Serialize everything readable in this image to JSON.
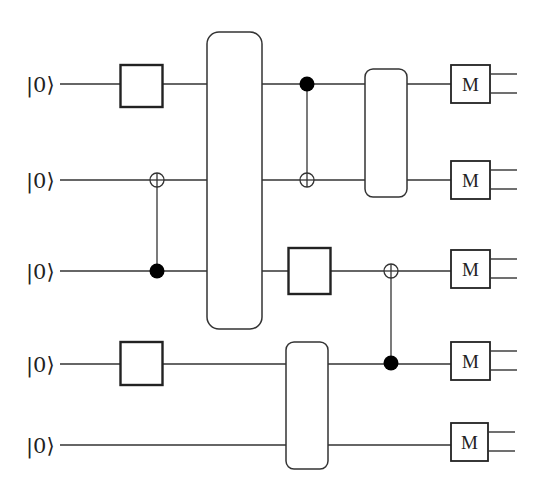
{
  "diagram": {
    "type": "quantum-circuit",
    "num_qubits": 5,
    "qubits": [
      {
        "index": 0,
        "label": "|0⟩",
        "y": 84
      },
      {
        "index": 1,
        "label": "|0⟩",
        "y": 180
      },
      {
        "index": 2,
        "label": "|0⟩",
        "y": 271
      },
      {
        "index": 3,
        "label": "|0⟩",
        "y": 364
      },
      {
        "index": 4,
        "label": "|0⟩",
        "y": 445
      }
    ],
    "gates": [
      {
        "id": "g1",
        "kind": "single-qubit-box",
        "qubit": 0,
        "label": ""
      },
      {
        "id": "g2",
        "kind": "single-qubit-box",
        "qubit": 3,
        "label": ""
      },
      {
        "id": "cnot1",
        "kind": "cnot",
        "control": 2,
        "target": 1
      },
      {
        "id": "u1",
        "kind": "multi-qubit-unitary",
        "qubits": [
          0,
          1,
          2
        ],
        "label": ""
      },
      {
        "id": "cnot2",
        "kind": "cnot",
        "control": 0,
        "target": 1
      },
      {
        "id": "g3",
        "kind": "single-qubit-box",
        "qubit": 2,
        "label": ""
      },
      {
        "id": "u2",
        "kind": "multi-qubit-unitary",
        "qubits": [
          3,
          4
        ],
        "label": ""
      },
      {
        "id": "u3",
        "kind": "multi-qubit-unitary",
        "qubits": [
          0,
          1
        ],
        "label": ""
      },
      {
        "id": "cnot3",
        "kind": "cnot",
        "control": 3,
        "target": 2
      }
    ],
    "measurements": [
      {
        "qubit": 0,
        "label": "M"
      },
      {
        "qubit": 1,
        "label": "M"
      },
      {
        "qubit": 2,
        "label": "M"
      },
      {
        "qubit": 3,
        "label": "M"
      },
      {
        "qubit": 4,
        "label": "M"
      }
    ],
    "colors": {
      "line": "#333333",
      "fill": "#ffffff",
      "control_dot": "#000000"
    }
  }
}
